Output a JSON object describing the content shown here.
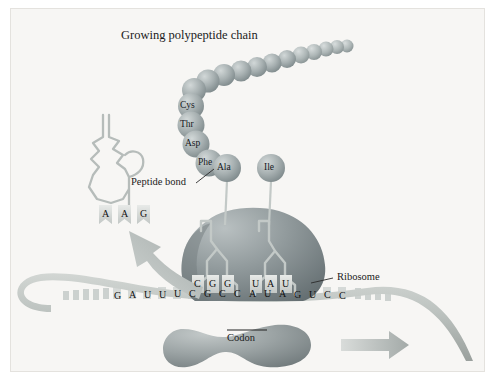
{
  "figure": {
    "domain": "biology-diagram",
    "topic": "Translation at the ribosome",
    "title": "Growing polypeptide chain",
    "background_color": "#f7f6f4",
    "ink_color": "#1b1b1b"
  },
  "labels": {
    "polypeptide": "Growing polypeptide chain",
    "peptide_bond": "Peptide bond",
    "ribosome": "Ribosome",
    "codon": "Codon"
  },
  "amino_acids": [
    {
      "name": "Cys",
      "x": 172,
      "y": 90
    },
    {
      "name": "Thr",
      "x": 172,
      "y": 108
    },
    {
      "name": "Asp",
      "x": 177,
      "y": 128
    },
    {
      "name": "Phe",
      "x": 190,
      "y": 147
    },
    {
      "name": "Ala",
      "x": 215,
      "y": 159
    },
    {
      "name": "Ile",
      "x": 259,
      "y": 159
    }
  ],
  "chain_beads": 13,
  "trna": {
    "exiting_anticodon": [
      "A",
      "A",
      "G"
    ],
    "site_p_anticodon": [
      "C",
      "G",
      "G"
    ],
    "site_a_anticodon": [
      "U",
      "A",
      "U"
    ]
  },
  "mrna": {
    "bases": [
      "G",
      "A",
      "U",
      "U",
      "U",
      "C",
      "G",
      "C",
      "C",
      "A",
      "U",
      "A",
      "G",
      "U",
      "C",
      "C"
    ],
    "codon_bracket_bases": [
      "C",
      "A",
      "U"
    ],
    "direction": "left-to-right"
  },
  "colors": {
    "bead": "#9fa9ab",
    "bead_highlight": "#c9d0d1",
    "ribosome_large": "#8d9699",
    "ribosome_small": "#9aa3a5",
    "mrna_ribbon": "#b9bfbd",
    "arrow": "#aab1b0",
    "trna_outline": "#b3b9b7"
  },
  "annotations": {
    "arrow_exit": "curved arrow showing tRNA leaving the ribosome",
    "arrow_move": "block arrow showing ribosome movement along mRNA"
  }
}
